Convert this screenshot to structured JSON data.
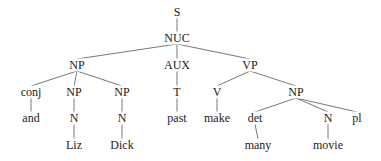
{
  "diagram": {
    "type": "syntax-tree",
    "nodes": [
      {
        "id": "S",
        "label": "S",
        "x": 177,
        "y": 12
      },
      {
        "id": "NUC",
        "label": "NUC",
        "x": 177,
        "y": 38
      },
      {
        "id": "NP1",
        "label": "NP",
        "x": 77,
        "y": 65
      },
      {
        "id": "AUX",
        "label": "AUX",
        "x": 177,
        "y": 65
      },
      {
        "id": "VP",
        "label": "VP",
        "x": 250,
        "y": 65
      },
      {
        "id": "conj",
        "label": "conj",
        "x": 31,
        "y": 92
      },
      {
        "id": "NP2",
        "label": "NP",
        "x": 74,
        "y": 92
      },
      {
        "id": "NP3",
        "label": "NP",
        "x": 122,
        "y": 92
      },
      {
        "id": "T",
        "label": "T",
        "x": 177,
        "y": 92
      },
      {
        "id": "V",
        "label": "V",
        "x": 217,
        "y": 92
      },
      {
        "id": "NP4",
        "label": "NP",
        "x": 296,
        "y": 92
      },
      {
        "id": "and",
        "label": "and",
        "x": 31,
        "y": 118
      },
      {
        "id": "N1",
        "label": "N",
        "x": 74,
        "y": 118
      },
      {
        "id": "N2",
        "label": "N",
        "x": 122,
        "y": 118
      },
      {
        "id": "past",
        "label": "past",
        "x": 177,
        "y": 118
      },
      {
        "id": "make",
        "label": "make",
        "x": 217,
        "y": 118
      },
      {
        "id": "det",
        "label": "det",
        "x": 255,
        "y": 118
      },
      {
        "id": "N3",
        "label": "N",
        "x": 328,
        "y": 118
      },
      {
        "id": "pl",
        "label": "pl",
        "x": 357,
        "y": 118
      },
      {
        "id": "Liz",
        "label": "Liz",
        "x": 74,
        "y": 145
      },
      {
        "id": "Dick",
        "label": "Dick",
        "x": 122,
        "y": 145
      },
      {
        "id": "many",
        "label": "many",
        "x": 258,
        "y": 145
      },
      {
        "id": "movie",
        "label": "movie",
        "x": 328,
        "y": 145
      }
    ],
    "edges": [
      [
        "S",
        "NUC"
      ],
      [
        "NUC",
        "NP1"
      ],
      [
        "NUC",
        "AUX"
      ],
      [
        "NUC",
        "VP"
      ],
      [
        "NP1",
        "conj"
      ],
      [
        "NP1",
        "NP2"
      ],
      [
        "NP1",
        "NP3"
      ],
      [
        "conj",
        "and"
      ],
      [
        "NP2",
        "N1"
      ],
      [
        "N1",
        "Liz"
      ],
      [
        "NP3",
        "N2"
      ],
      [
        "N2",
        "Dick"
      ],
      [
        "AUX",
        "T"
      ],
      [
        "T",
        "past"
      ],
      [
        "VP",
        "V"
      ],
      [
        "VP",
        "NP4"
      ],
      [
        "V",
        "make"
      ],
      [
        "NP4",
        "det"
      ],
      [
        "NP4",
        "N3"
      ],
      [
        "NP4",
        "pl"
      ],
      [
        "det",
        "many"
      ],
      [
        "N3",
        "movie"
      ]
    ],
    "line_color": "#555555",
    "text_color": "#222222"
  }
}
